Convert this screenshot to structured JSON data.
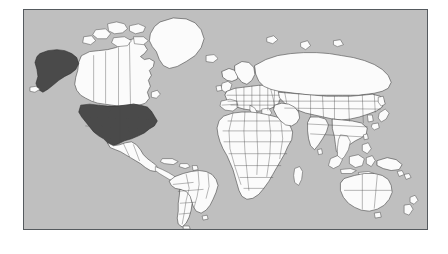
{
  "figure": {
    "type": "world-map",
    "projection": "equirectangular",
    "frame_border_color": "#555a5e",
    "page_background": "#ffffff"
  },
  "legend": {
    "ocean_color": "#bfbfbf",
    "land_color": "#fbfbfb",
    "land_border_color": "#3a3a3a",
    "highlight_color": "#4a4a4a"
  },
  "map": {
    "title": "",
    "highlighted_regions": [
      {
        "name": "United States (contiguous)",
        "color": "#4a4a4a"
      },
      {
        "name": "Alaska",
        "color": "#4a4a4a"
      }
    ],
    "continents": [
      "North America",
      "South America",
      "Europe",
      "Africa",
      "Asia",
      "Oceania"
    ],
    "notable_landmasses": [
      "Greenland",
      "Canada",
      "United States",
      "Alaska",
      "Mexico",
      "Brazil",
      "Argentina",
      "Russia",
      "China",
      "India",
      "Australia",
      "New Zealand",
      "Madagascar",
      "Japan",
      "Indonesia",
      "United Kingdom",
      "Iceland"
    ]
  }
}
